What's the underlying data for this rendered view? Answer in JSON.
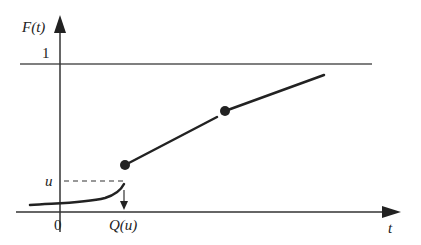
{
  "diagram": {
    "y_axis_label": "F(t)",
    "x_axis_label": "t",
    "y_tick_one": "1",
    "y_tick_u": "u",
    "x_tick_zero": "0",
    "x_tick_q": "Q(u)",
    "colors": {
      "curve": "#222222",
      "axis": "#333333",
      "background": "#ffffff"
    }
  }
}
